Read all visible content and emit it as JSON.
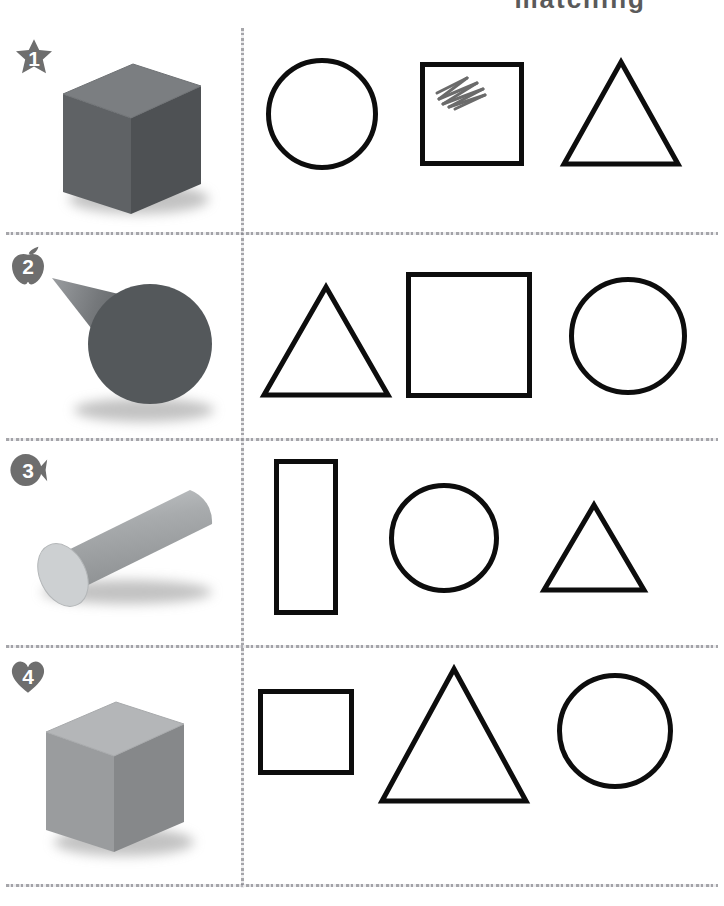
{
  "worksheet": {
    "header_fragment": "matching",
    "badge_shape_names": [
      "star-badge",
      "apple-badge",
      "fish-badge",
      "heart-badge"
    ],
    "badge_color": "#6e6e6e",
    "divider_color": "#9a9a9f",
    "shape_outline_color": "#0d0d0d",
    "mark_color": "#6b6b6b"
  },
  "rows": [
    {
      "number": "1",
      "badge_name": "star-badge",
      "solid": {
        "name": "cube",
        "label": "cube",
        "color": "#5f6265",
        "top_color": "#7b7e81",
        "side_color": "#4e5154"
      },
      "options": [
        {
          "shape": "circle",
          "label": "circle",
          "marked": "false"
        },
        {
          "shape": "square",
          "label": "square",
          "marked": "true"
        },
        {
          "shape": "triangle",
          "label": "triangle",
          "marked": "false"
        }
      ]
    },
    {
      "number": "2",
      "badge_name": "apple-badge",
      "solid": {
        "name": "cone",
        "label": "cone",
        "color": "#5b5e61",
        "top_color": "#8a8d90",
        "side_color": "#4c4f52"
      },
      "options": [
        {
          "shape": "triangle",
          "label": "triangle",
          "marked": "false"
        },
        {
          "shape": "square",
          "label": "square",
          "marked": "false"
        },
        {
          "shape": "circle",
          "label": "circle",
          "marked": "false"
        }
      ]
    },
    {
      "number": "3",
      "badge_name": "fish-badge",
      "solid": {
        "name": "cylinder",
        "label": "cylinder",
        "color": "#a9acae",
        "top_color": "#c8cbcd",
        "side_color": "#9a9d9f"
      },
      "options": [
        {
          "shape": "rectangle",
          "label": "rectangle",
          "marked": "false"
        },
        {
          "shape": "circle",
          "label": "circle",
          "marked": "false"
        },
        {
          "shape": "triangle",
          "label": "triangle",
          "marked": "false"
        }
      ]
    },
    {
      "number": "4",
      "badge_name": "heart-badge",
      "solid": {
        "name": "cube",
        "label": "cube",
        "color": "#9a9c9e",
        "top_color": "#b4b6b8",
        "side_color": "#86888a"
      },
      "options": [
        {
          "shape": "square",
          "label": "square",
          "marked": "false"
        },
        {
          "shape": "triangle",
          "label": "triangle",
          "marked": "false"
        },
        {
          "shape": "circle",
          "label": "circle",
          "marked": "false"
        }
      ]
    }
  ]
}
